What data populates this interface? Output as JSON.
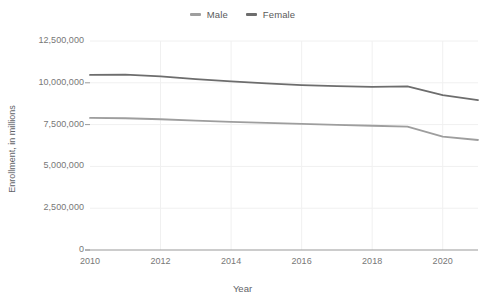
{
  "chart_data": {
    "type": "line",
    "title": "",
    "xlabel": "Year",
    "ylabel": "Enrollment, in millions",
    "x": [
      2010,
      2011,
      2012,
      2013,
      2014,
      2015,
      2016,
      2017,
      2018,
      2019,
      2020,
      2021
    ],
    "xlim": [
      2010,
      2021
    ],
    "ylim": [
      0,
      12500000
    ],
    "xticks": [
      "2010",
      "2012",
      "2014",
      "2016",
      "2018",
      "2020"
    ],
    "xtick_values": [
      2010,
      2012,
      2014,
      2016,
      2018,
      2020
    ],
    "yticks": [
      "0",
      "2,500,000",
      "5,000,000",
      "7,500,000",
      "10,000,000",
      "12,500,000"
    ],
    "ytick_values": [
      0,
      2500000,
      5000000,
      7500000,
      10000000,
      12500000
    ],
    "grid": true,
    "legend_position": "top-center",
    "series": [
      {
        "name": "Male",
        "color": "#9e9e9e",
        "values": [
          7900000,
          7880000,
          7820000,
          7740000,
          7660000,
          7600000,
          7540000,
          7480000,
          7430000,
          7380000,
          6780000,
          6580000
        ]
      },
      {
        "name": "Female",
        "color": "#6d6d6d",
        "values": [
          10470000,
          10490000,
          10380000,
          10220000,
          10080000,
          9960000,
          9860000,
          9800000,
          9760000,
          9790000,
          9260000,
          8970000
        ]
      }
    ]
  },
  "legend": {
    "entries": [
      {
        "label": "Male",
        "color": "#9e9e9e"
      },
      {
        "label": "Female",
        "color": "#6d6d6d"
      }
    ]
  },
  "axes": {
    "y_title": "Enrollment, in millions",
    "x_title": "Year"
  },
  "colors": {
    "background": "#ffffff",
    "grid": "#f0f0f0",
    "axis": "#9a9a9a",
    "tick_text": "#777777",
    "label_text": "#5f6368"
  }
}
